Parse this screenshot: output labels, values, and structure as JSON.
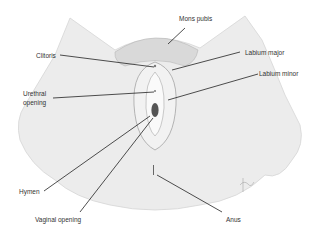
{
  "diagram": {
    "type": "anatomical-labeled-illustration",
    "labels": [
      {
        "id": "mons_pubis",
        "text": "Mons pubis"
      },
      {
        "id": "clitoris",
        "text": "Clitoris"
      },
      {
        "id": "labium_major",
        "text": "Labium major"
      },
      {
        "id": "labium_minor",
        "text": "Labium minor"
      },
      {
        "id": "urethral_opening_1",
        "text": "Urethral"
      },
      {
        "id": "urethral_opening_2",
        "text": "opening"
      },
      {
        "id": "hymen",
        "text": "Hymen"
      },
      {
        "id": "vaginal_opening",
        "text": "Vaginal opening"
      },
      {
        "id": "anus",
        "text": "Anus"
      }
    ],
    "colors": {
      "skin_fill": "#ececec",
      "outline": "#9a9a9a",
      "leader_line": "#222222",
      "label_text": "#333333"
    }
  }
}
